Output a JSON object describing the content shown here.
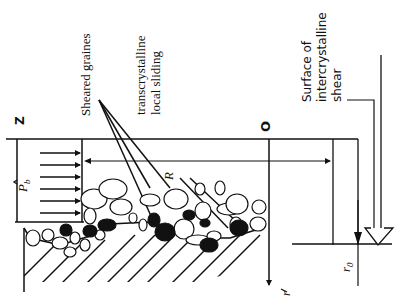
{
  "diagram": {
    "orientation": "rotated 90 degrees counter-clockwise",
    "labels": {
      "sheared_grains": "Sheared graines",
      "transcrystalline_line1": "transcrystalline",
      "transcrystalline_line2": "local sliding",
      "surface_line1": "Surface of",
      "surface_line2": "intercrystalline",
      "surface_line3": "shear",
      "axis_z": "Z",
      "origin": "O",
      "axis_r": "r",
      "pressure": "P",
      "pressure_sub": "b",
      "radius": "R",
      "radius_0": "r",
      "radius_0_sub": "0"
    },
    "colors": {
      "ink": "#111111",
      "background": "#ffffff"
    }
  }
}
